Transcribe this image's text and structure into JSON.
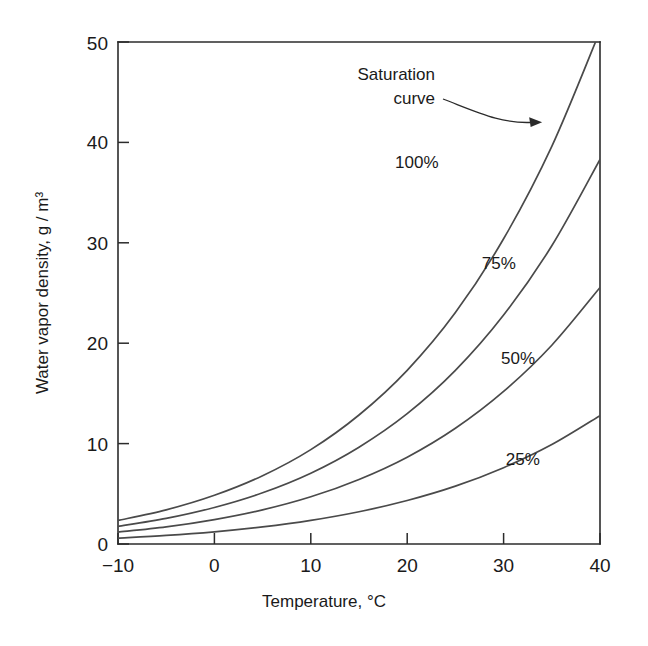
{
  "chart_data": {
    "type": "line",
    "title": "",
    "subtitle": "",
    "xlabel": "Temperature, °C",
    "ylabel": "Water vapor density, g / m³",
    "xlim": [
      -10,
      40
    ],
    "ylim": [
      0,
      50
    ],
    "xticks": [
      -10,
      0,
      10,
      20,
      30,
      40
    ],
    "xticklabels": [
      "−10",
      "0",
      "10",
      "20",
      "30",
      "40"
    ],
    "yticks": [
      0,
      10,
      20,
      30,
      40,
      50
    ],
    "yticklabels": [
      "0",
      "10",
      "20",
      "30",
      "40",
      "50"
    ],
    "grid": false,
    "legend_position": "inline-curve-labels",
    "x": [
      -10,
      -5,
      0,
      5,
      10,
      15,
      20,
      25,
      30,
      35,
      40
    ],
    "series": [
      {
        "name": "100%",
        "label": "100%",
        "label_x": 21.0,
        "label_y": 38.0,
        "values": [
          2.35,
          3.4,
          4.85,
          6.8,
          9.4,
          12.85,
          17.3,
          23.05,
          30.4,
          39.6,
          51.1
        ],
        "clipped_at_top": true,
        "exit_temperature": 37.0
      },
      {
        "name": "75%",
        "label": "75%",
        "label_x": 29.5,
        "label_y": 28.0,
        "values": [
          1.76,
          2.55,
          3.64,
          5.1,
          7.05,
          9.64,
          12.98,
          17.29,
          22.8,
          29.7,
          38.3
        ]
      },
      {
        "name": "50%",
        "label": "50%",
        "label_x": 31.5,
        "label_y": 18.5,
        "values": [
          1.18,
          1.7,
          2.43,
          3.4,
          4.7,
          6.43,
          8.65,
          11.53,
          15.2,
          19.8,
          25.55
        ]
      },
      {
        "name": "25%",
        "label": "25%",
        "label_x": 32.0,
        "label_y": 8.5,
        "values": [
          0.59,
          0.85,
          1.21,
          1.7,
          2.35,
          3.21,
          4.33,
          5.76,
          7.6,
          9.9,
          12.78
        ]
      }
    ],
    "annotations": [
      {
        "text_line1": "Saturation",
        "text_line2": "curve",
        "text": "Saturation curve",
        "target_temperature": 34.0,
        "target_density": 42.0
      }
    ],
    "colors": {
      "background": "#ffffff",
      "axis": "#2b2b2b",
      "curve": "#4a4a4a",
      "text": "#1a1a1a"
    }
  }
}
